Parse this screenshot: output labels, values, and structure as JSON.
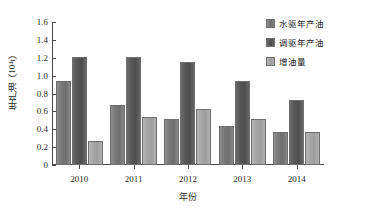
{
  "chart_data": {
    "type": "bar",
    "title": "",
    "xlabel": "年份",
    "ylabel": "年产油（10⁴t）",
    "categories": [
      "2010",
      "2011",
      "2012",
      "2013",
      "2014"
    ],
    "series": [
      {
        "name": "水驱年产油",
        "values": [
          0.94,
          0.67,
          0.52,
          0.44,
          0.37
        ],
        "color": "#7a7a7a"
      },
      {
        "name": "调驱年产油",
        "values": [
          1.21,
          1.21,
          1.15,
          0.94,
          0.73
        ],
        "color": "#585858"
      },
      {
        "name": "增油量",
        "values": [
          0.27,
          0.54,
          0.63,
          0.52,
          0.37
        ],
        "color": "#a6a6a6"
      }
    ],
    "ylim": [
      0,
      1.6
    ],
    "ytick_labels": [
      "0",
      "0.2",
      "0.4",
      "0.6",
      "0.8",
      "1.0",
      "1.2",
      "1.4",
      "1.6"
    ],
    "ytick_values": [
      0,
      0.2,
      0.4,
      0.6,
      0.8,
      1.0,
      1.2,
      1.4,
      1.6
    ],
    "grid": false,
    "legend_position": "top-right"
  }
}
